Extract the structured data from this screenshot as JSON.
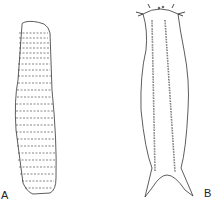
{
  "figure": {
    "panels": [
      {
        "id": "A",
        "label": "A",
        "description": "elongated segmented worm, dorsal view"
      },
      {
        "id": "B",
        "label": "B",
        "description": "worm with paired ventral bristle rows, head tentacles and forked tail"
      }
    ]
  },
  "colors": {
    "ink": "#333333",
    "background": "#ffffff"
  }
}
